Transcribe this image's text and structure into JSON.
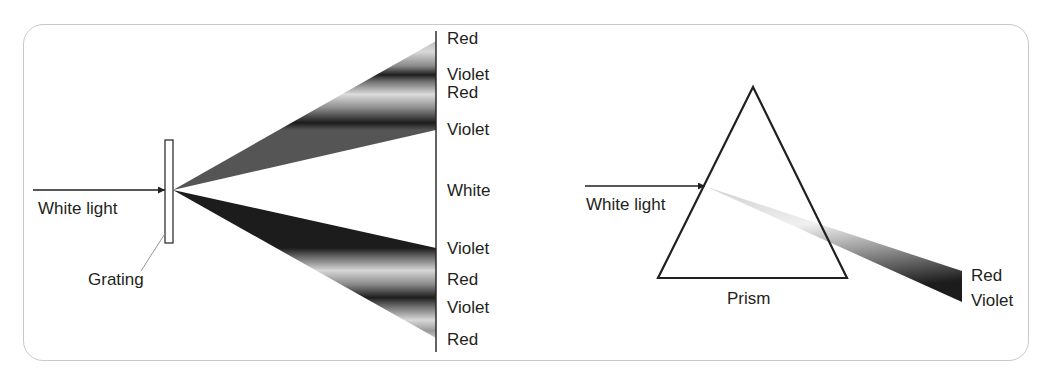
{
  "grating_panel": {
    "input_label": "White light",
    "grating_label": "Grating",
    "screen_labels": [
      {
        "text": "Red",
        "y": 41
      },
      {
        "text": "Violet",
        "y": 75
      },
      {
        "text": "Red",
        "y": 92
      },
      {
        "text": "Violet",
        "y": 130
      },
      {
        "text": "White",
        "y": 190
      },
      {
        "text": "Violet",
        "y": 248
      },
      {
        "text": "Red",
        "y": 279
      },
      {
        "text": "Violet",
        "y": 308
      },
      {
        "text": "Red",
        "y": 340
      }
    ]
  },
  "prism_panel": {
    "input_label": "White light",
    "prism_label": "Prism",
    "output_labels": [
      {
        "text": "Red"
      },
      {
        "text": "Violet"
      }
    ]
  },
  "colors": {
    "frame_border": "#c9c9c9",
    "line": "#231f20",
    "text": "#231f20"
  }
}
